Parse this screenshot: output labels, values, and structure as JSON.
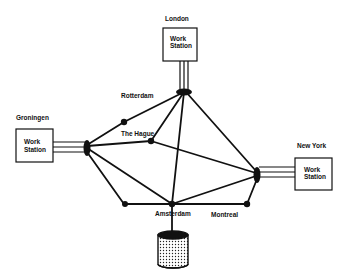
{
  "diagram": {
    "type": "network topology",
    "workstations": [
      {
        "id": "london",
        "city": "London",
        "label_line1": "Work",
        "label_line2": "Station"
      },
      {
        "id": "groningen",
        "city": "Groningen",
        "label_line1": "Work",
        "label_line2": "Station"
      },
      {
        "id": "newyork",
        "city": "New York",
        "label_line1": "Work",
        "label_line2": "Station"
      }
    ],
    "nodes": [
      {
        "id": "rotterdam",
        "label": "Rotterdam"
      },
      {
        "id": "hague",
        "label": "The Hague"
      },
      {
        "id": "amsterdam",
        "label": "Amsterdam"
      },
      {
        "id": "montreal",
        "label": "Montreal"
      },
      {
        "id": "unnamed",
        "label": ""
      }
    ],
    "storage": {
      "id": "database",
      "label": ""
    },
    "links": [
      [
        "london",
        "rotterdam"
      ],
      [
        "london",
        "hague"
      ],
      [
        "london",
        "amsterdam"
      ],
      [
        "london",
        "newyork"
      ],
      [
        "rotterdam",
        "groningen"
      ],
      [
        "groningen",
        "hague"
      ],
      [
        "groningen",
        "amsterdam"
      ],
      [
        "groningen",
        "unnamed"
      ],
      [
        "unnamed",
        "amsterdam"
      ],
      [
        "hague",
        "newyork"
      ],
      [
        "amsterdam",
        "newyork"
      ],
      [
        "amsterdam",
        "montreal"
      ],
      [
        "montreal",
        "newyork"
      ],
      [
        "amsterdam",
        "database"
      ]
    ]
  }
}
